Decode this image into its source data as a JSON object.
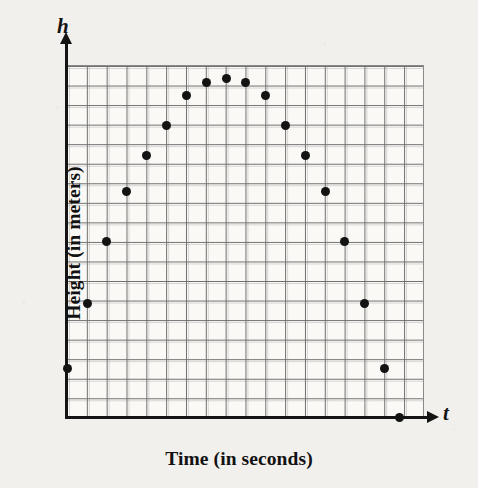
{
  "figure": {
    "axis_symbols": {
      "vertical": "h",
      "horizontal": "t"
    },
    "axis_titles": {
      "y": "Height (in meters)",
      "x": "Time (in seconds)"
    },
    "colors": {
      "background": "#f2f0ec",
      "plot_background": "#faf9f6",
      "grid_line": "#6e6e6e",
      "axis": "#141414",
      "point": "#131313"
    }
  },
  "chart_data": {
    "type": "scatter",
    "title": "",
    "xlabel": "Time (in seconds)",
    "ylabel": "Height (in meters)",
    "x_symbol": "t",
    "y_symbol": "h",
    "grid": true,
    "legend": false,
    "xlim": [
      0,
      18
    ],
    "ylim": [
      0,
      18
    ],
    "grid_columns": 18,
    "grid_rows": 18,
    "x": [
      0,
      1,
      2,
      3,
      4,
      5,
      6,
      7,
      8,
      9,
      10,
      11,
      12,
      13,
      14,
      15,
      16,
      17
    ],
    "y": [
      2.5,
      5.8,
      9.0,
      11.6,
      13.7,
      15.3,
      16.4,
      17.0,
      17.2,
      17.0,
      16.4,
      15.3,
      13.7,
      11.6,
      9.0,
      5.8,
      2.5,
      0.0
    ],
    "points": [
      {
        "t": 0,
        "h": 2.5,
        "px": 67,
        "py": 368
      },
      {
        "t": 1,
        "h": 5.8,
        "px": 87,
        "py": 303
      },
      {
        "t": 2,
        "h": 9.0,
        "px": 106,
        "py": 241
      },
      {
        "t": 3,
        "h": 11.6,
        "px": 126,
        "py": 191
      },
      {
        "t": 4,
        "h": 13.7,
        "px": 146,
        "py": 155
      },
      {
        "t": 5,
        "h": 15.3,
        "px": 166,
        "py": 125
      },
      {
        "t": 6,
        "h": 16.4,
        "px": 186,
        "py": 95
      },
      {
        "t": 7,
        "h": 17.0,
        "px": 206,
        "py": 82
      },
      {
        "t": 8,
        "h": 17.2,
        "px": 226,
        "py": 78
      },
      {
        "t": 9,
        "h": 17.0,
        "px": 245,
        "py": 82
      },
      {
        "t": 10,
        "h": 16.4,
        "px": 265,
        "py": 95
      },
      {
        "t": 11,
        "h": 15.3,
        "px": 285,
        "py": 125
      },
      {
        "t": 12,
        "h": 13.7,
        "px": 305,
        "py": 155
      },
      {
        "t": 13,
        "h": 11.6,
        "px": 325,
        "py": 191
      },
      {
        "t": 14,
        "h": 9.0,
        "px": 344,
        "py": 241
      },
      {
        "t": 15,
        "h": 5.8,
        "px": 364,
        "py": 303
      },
      {
        "t": 16,
        "h": 2.5,
        "px": 384,
        "py": 368
      },
      {
        "t": 17,
        "h": 0.0,
        "px": 399,
        "py": 417
      }
    ]
  }
}
